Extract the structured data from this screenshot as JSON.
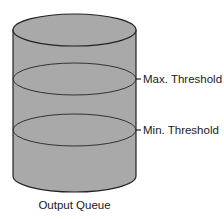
{
  "diagram": {
    "title": "Output Queue",
    "thresholds": [
      {
        "label": "Max. Threshold",
        "y": 79
      },
      {
        "label": "Min. Threshold",
        "y": 130
      }
    ],
    "colors": {
      "fill": "#a9a9a9",
      "stroke": "#222222",
      "text": "#1a1a1a"
    }
  }
}
